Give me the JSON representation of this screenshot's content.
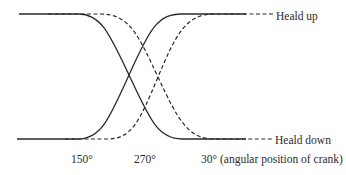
{
  "diagram": {
    "type": "heald motion timing diagram",
    "labels": {
      "heald_up": "Heald up",
      "heald_down": "Heald down"
    },
    "x_ticks": [
      {
        "label": "150°"
      },
      {
        "label": "270°"
      },
      {
        "label": "30° (angular position of crank)"
      }
    ],
    "curves": [
      {
        "name": "heald-1-falling",
        "style": "solid",
        "from": "up",
        "to": "down"
      },
      {
        "name": "heald-2-rising",
        "style": "solid",
        "from": "down",
        "to": "up"
      },
      {
        "name": "heald-3-falling-delayed",
        "style": "dashed",
        "from": "up",
        "to": "down"
      },
      {
        "name": "heald-4-rising-delayed",
        "style": "dashed",
        "from": "down",
        "to": "up"
      }
    ],
    "colors": {
      "stroke": "#2a2a2a",
      "background": "#ffffff"
    }
  }
}
